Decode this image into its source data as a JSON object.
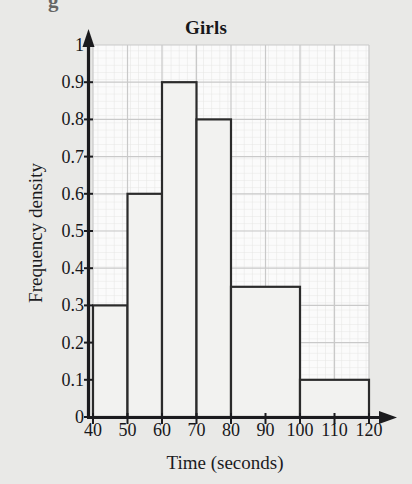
{
  "figure": {
    "title": "Girls",
    "stray_glyph": "g",
    "background_color": "#e9e9e7",
    "grid_color": "#c9c9c9",
    "minor_grid_color": "#e0e0e0",
    "axis_color": "#1b1b1e",
    "bar_edge_color": "#2b2b2b",
    "bar_fill_color": "#f2f2f0",
    "text_color": "#17171a"
  },
  "chart_data": {
    "type": "bar",
    "title": "Girls",
    "xlabel": "Time (seconds)",
    "ylabel": "Frequency density",
    "xlim": [
      40,
      120
    ],
    "ylim": [
      0,
      1
    ],
    "grid": true,
    "legend": "none",
    "x_tick_labels": [
      "40",
      "50",
      "60",
      "70",
      "80",
      "90",
      "100",
      "110",
      "120"
    ],
    "x_tick_values": [
      40,
      50,
      60,
      70,
      80,
      90,
      100,
      110,
      120
    ],
    "y_tick_labels": [
      "0",
      "0.1",
      "0.2",
      "0.3",
      "0.4",
      "0.5",
      "0.6",
      "0.7",
      "0.8",
      "0.9",
      "1"
    ],
    "y_tick_values": [
      0,
      0.1,
      0.2,
      0.3,
      0.4,
      0.5,
      0.6,
      0.7,
      0.8,
      0.9,
      1
    ],
    "bins": [
      {
        "label": "40-50",
        "start": 40,
        "end": 50,
        "value": 0.3
      },
      {
        "label": "50-60",
        "start": 50,
        "end": 60,
        "value": 0.6
      },
      {
        "label": "60-70",
        "start": 60,
        "end": 70,
        "value": 0.9
      },
      {
        "label": "70-80",
        "start": 70,
        "end": 80,
        "value": 0.8
      },
      {
        "label": "80-100",
        "start": 80,
        "end": 100,
        "value": 0.35
      },
      {
        "label": "100-120",
        "start": 100,
        "end": 120,
        "value": 0.1
      }
    ],
    "categories": [
      "40-50",
      "50-60",
      "60-70",
      "70-80",
      "80-100",
      "100-120"
    ],
    "values": [
      0.3,
      0.6,
      0.9,
      0.8,
      0.35,
      0.1
    ]
  }
}
